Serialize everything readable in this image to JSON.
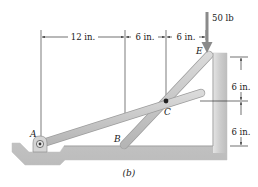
{
  "figure": {
    "caption": "(b)",
    "load": {
      "label": "50 lb"
    },
    "points": {
      "A": "A",
      "B": "B",
      "C": "C",
      "E": "E"
    },
    "horizontal_dimensions": [
      {
        "label": "12 in."
      },
      {
        "label": "6 in."
      },
      {
        "label": "6 in."
      }
    ],
    "vertical_dimensions": [
      {
        "label": "6 in."
      },
      {
        "label": "6 in."
      }
    ],
    "colors": {
      "bar_fill": "#c9c9c9",
      "bar_edge": "#a5a5a5",
      "ground_fill": "#cfcfcf",
      "ground_shade": "#b8b8b8",
      "line": "#333333",
      "pin": "#222222"
    }
  }
}
